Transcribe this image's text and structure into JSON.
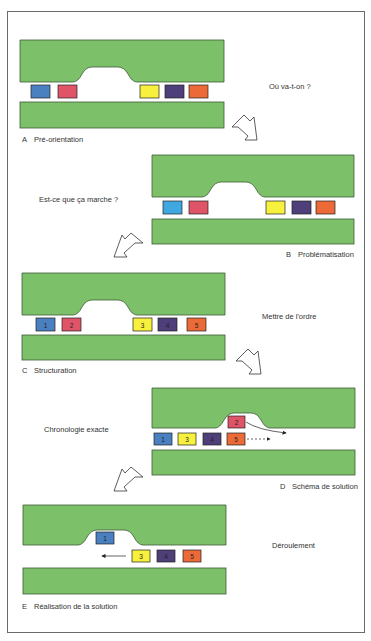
{
  "colors": {
    "green": "#7dc06a",
    "green_edge": "#3d5a35",
    "blue": "#4a7fc0",
    "red": "#e05468",
    "yellow": "#f7f03c",
    "purple": "#4e3f7a",
    "orange": "#ec6a38",
    "lightblue": "#3fa8e0"
  },
  "stages": [
    {
      "letter": "A",
      "title": "Pré-orientation",
      "question": "Où va-t-on ?"
    },
    {
      "letter": "B",
      "title": "Problématisation",
      "question": "Est-ce que ça marche ?"
    },
    {
      "letter": "C",
      "title": "Structuration",
      "question": "Mettre de l'ordre"
    },
    {
      "letter": "D",
      "title": "Schéma de solution",
      "question": "Chronologie exacte"
    },
    {
      "letter": "E",
      "title": "Réalisation de la solution",
      "question": "Déroulement"
    }
  ],
  "blocks": {
    "C": [
      "1",
      "2",
      "3",
      "4",
      "5"
    ],
    "D_row": [
      "1",
      "3",
      "4",
      "5"
    ],
    "D_raised": "2",
    "E_raised": "1",
    "E_row": [
      "3",
      "4",
      "5"
    ]
  }
}
